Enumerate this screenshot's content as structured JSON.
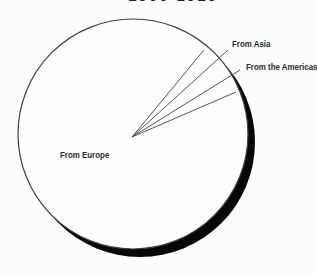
{
  "page": {
    "background": "#fcfcfc"
  },
  "header": {
    "title_fragment": "1900-1910"
  },
  "chart_data": {
    "type": "pie",
    "title": "1900-1910",
    "title_note": "title line is cropped at the top edge of the image; only the bottom sliver of the text is visible",
    "categories": [
      "From Europe",
      "From Asia",
      "From the Americas"
    ],
    "values_pct_estimated": [
      92,
      3,
      5
    ],
    "legend_position": "none",
    "style_note": "monochrome textbook pie: white disc with thin outline, solid black drop shadow offset to lower-right, hairline slice boundaries and leader lines radiating from center to labels",
    "colors": {
      "background": "#fcfcfc",
      "pie_fill": "#fdfdfd",
      "outline": "#3f3f3f",
      "shadow": "#070707",
      "leader_line": "#555555",
      "label_text": "#2b2b2b"
    },
    "geometry": {
      "circle": {
        "cx": 133,
        "cy": 134,
        "r": 115
      },
      "shadow_offset": {
        "dx": 7,
        "dy": 8
      },
      "line_origin": {
        "x": 132,
        "y": 137
      },
      "lines": [
        {
          "name": "slice-boundary-upper-line",
          "x": 204,
          "y": 50
        },
        {
          "name": "leader-line-from-asia",
          "x": 228,
          "y": 50
        },
        {
          "name": "leader-line-from-the-americas",
          "x": 240,
          "y": 70
        },
        {
          "name": "slice-boundary-lower-line",
          "x": 236,
          "y": 92
        }
      ],
      "labels": [
        {
          "text": "From Asia",
          "x": 232,
          "y": 40
        },
        {
          "text": "From the Americas",
          "x": 246,
          "y": 63
        },
        {
          "text": "From Europe",
          "x": 60,
          "y": 151
        }
      ]
    }
  }
}
